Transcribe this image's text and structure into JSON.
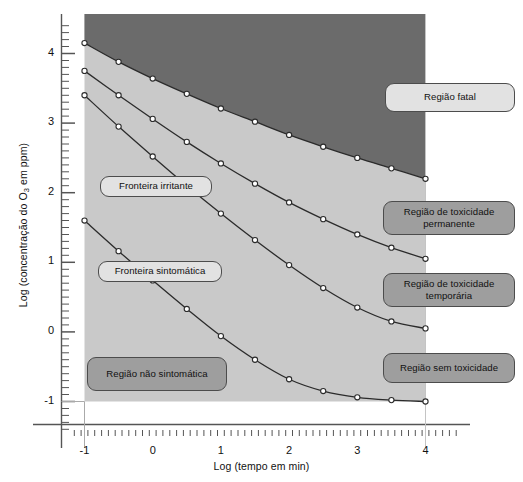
{
  "chart_data": {
    "type": "line",
    "title": "",
    "xlabel": "Log (tempo em min)",
    "ylabel_parts": {
      "pre": "Log (concentração do O",
      "sub": "3",
      "post": " em ppm)"
    },
    "ylabel": "Log (concentração do O3 em ppm)",
    "xlim": [
      -1.4,
      4.6
    ],
    "ylim": [
      -1.45,
      4.55
    ],
    "xticks": [
      -1,
      0,
      1,
      2,
      3,
      4
    ],
    "yticks": [
      -1,
      0,
      1,
      2,
      3,
      4
    ],
    "xtick_labels": [
      "-1",
      "0",
      "1",
      "2",
      "3",
      "4"
    ],
    "ytick_labels": [
      "-1",
      "0",
      "1",
      "2",
      "3",
      "4"
    ],
    "minor_tick_step": 0.1,
    "grid": false,
    "legend_position": "none",
    "marker": "open-circle",
    "marker_step": 0.5,
    "series": [
      {
        "name": "Fronteira fatal",
        "x": [
          -1,
          -0.5,
          0,
          0.5,
          1,
          1.5,
          2,
          2.5,
          3,
          3.5,
          4
        ],
        "values": [
          4.15,
          3.88,
          3.64,
          3.42,
          3.21,
          3.02,
          2.83,
          2.66,
          2.5,
          2.35,
          2.2
        ]
      },
      {
        "name": "Fronteira de toxicidade permanente",
        "x": [
          -1,
          -0.5,
          0,
          0.5,
          1,
          1.5,
          2,
          2.5,
          3,
          3.5,
          4
        ],
        "values": [
          3.75,
          3.4,
          3.06,
          2.73,
          2.42,
          2.13,
          1.86,
          1.62,
          1.4,
          1.21,
          1.05
        ]
      },
      {
        "name": "Fronteira irritante",
        "x": [
          -1,
          -0.5,
          0,
          0.5,
          1,
          1.5,
          2,
          2.5,
          3,
          3.5,
          4
        ],
        "values": [
          3.4,
          2.95,
          2.52,
          2.1,
          1.7,
          1.32,
          0.96,
          0.63,
          0.35,
          0.15,
          0.05
        ]
      },
      {
        "name": "Fronteira sintomática",
        "x": [
          -1,
          -0.5,
          0,
          0.5,
          1,
          1.5,
          2,
          2.5,
          3,
          3.5,
          4
        ],
        "values": [
          1.6,
          1.16,
          0.74,
          0.33,
          -0.06,
          -0.4,
          -0.68,
          -0.85,
          -0.94,
          -0.98,
          -1.0
        ]
      }
    ],
    "regions": [
      {
        "name": "fatal",
        "color": "#6b6b6b"
      },
      {
        "name": "toxicidade",
        "color": "#c9c9c9"
      }
    ],
    "colors": {
      "fatal_fill": "#6b6b6b",
      "plot_fill": "#c9c9c9",
      "curve": "#2b2b2b",
      "axis": "#8a8a8a",
      "callout_light": "#e2e2e2",
      "callout_dark": "#9e9e9e"
    }
  },
  "callouts": {
    "fronteira_irritante": "Fronteira irritante",
    "fronteira_sintomatica": "Fronteira sintomática",
    "regiao_nao_sintomatica": "Região não sintomática",
    "regiao_fatal": "Região fatal",
    "regiao_toxicidade_permanente_l1": "Região de toxicidade",
    "regiao_toxicidade_permanente_l2": "permanente",
    "regiao_toxicidade_temporaria_l1": "Região de toxicidade",
    "regiao_toxicidade_temporaria_l2": "temporária",
    "regiao_sem_toxicidade": "Região sem toxicidade"
  }
}
